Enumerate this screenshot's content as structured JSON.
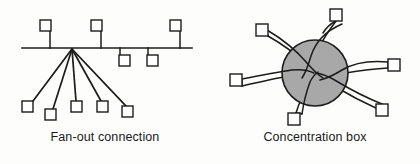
{
  "figure": {
    "width": 420,
    "height": 164,
    "background_color": "#fdfdfc",
    "line_color": "#1c1c1c",
    "hub_fill_color": "#a8a8a8",
    "node_fill_color": "#ffffff"
  },
  "panels": [
    {
      "id": "fanout",
      "caption": "Fan-out connection",
      "diagram_type": "bus-with-fanout",
      "bus": {
        "y": 48,
        "x_start": 22,
        "x_end": 192,
        "stroke_width": 1.6
      },
      "fanout_origin": {
        "x": 72,
        "y": 49
      },
      "bus_taps": [
        {
          "id": "tap-1",
          "side": "above",
          "box": {
            "x": 40,
            "y": 20,
            "size": 11
          },
          "drop_x": 50,
          "drop_from_y": 31,
          "drop_to_y": 48
        },
        {
          "id": "tap-2",
          "side": "above",
          "box": {
            "x": 91,
            "y": 20,
            "size": 11
          },
          "drop_x": 101,
          "drop_from_y": 31,
          "drop_to_y": 48
        },
        {
          "id": "tap-3",
          "side": "above",
          "box": {
            "x": 170,
            "y": 20,
            "size": 11
          },
          "drop_x": 180,
          "drop_from_y": 31,
          "drop_to_y": 48
        },
        {
          "id": "tap-4",
          "side": "below",
          "box": {
            "x": 119,
            "y": 55,
            "size": 11
          },
          "drop_x": 120,
          "drop_from_y": 48,
          "drop_to_y": 55
        },
        {
          "id": "tap-5",
          "side": "below",
          "box": {
            "x": 147,
            "y": 55,
            "size": 11
          },
          "drop_x": 148,
          "drop_from_y": 48,
          "drop_to_y": 55
        }
      ],
      "fanout_leaves": [
        {
          "id": "leaf-1",
          "box": {
            "x": 22,
            "y": 101,
            "size": 11
          },
          "attach": {
            "x": 32,
            "y": 101
          }
        },
        {
          "id": "leaf-2",
          "box": {
            "x": 45,
            "y": 109,
            "size": 11
          },
          "attach": {
            "x": 52,
            "y": 109
          }
        },
        {
          "id": "leaf-3",
          "box": {
            "x": 71,
            "y": 101,
            "size": 11
          },
          "attach": {
            "x": 76,
            "y": 101
          }
        },
        {
          "id": "leaf-4",
          "box": {
            "x": 97,
            "y": 101,
            "size": 11
          },
          "attach": {
            "x": 101,
            "y": 101
          }
        },
        {
          "id": "leaf-5",
          "box": {
            "x": 122,
            "y": 106,
            "size": 11
          },
          "attach": {
            "x": 125,
            "y": 106
          }
        }
      ],
      "leaf_count": 5,
      "tap_count": 5
    },
    {
      "id": "concentration",
      "caption": "Concentration box",
      "diagram_type": "star-hub",
      "hub": {
        "cx": 105,
        "cy": 73,
        "r": 33
      },
      "node_count": 6,
      "nodes": [
        {
          "id": "node-top-right",
          "box": {
            "x": 120,
            "y": 9,
            "size": 12
          },
          "label_position": "top-right"
        },
        {
          "id": "node-upper-left",
          "box": {
            "x": 46,
            "y": 24,
            "size": 12
          },
          "label_position": "upper-left"
        },
        {
          "id": "node-left",
          "box": {
            "x": 20,
            "y": 74,
            "size": 12
          },
          "label_position": "left"
        },
        {
          "id": "node-right",
          "box": {
            "x": 178,
            "y": 59,
            "size": 12
          },
          "label_position": "right"
        },
        {
          "id": "node-lower-right",
          "box": {
            "x": 166,
            "y": 104,
            "size": 12
          },
          "label_position": "lower-right"
        },
        {
          "id": "node-bottom",
          "box": {
            "x": 78,
            "y": 113,
            "size": 12
          },
          "label_position": "bottom"
        }
      ]
    }
  ]
}
